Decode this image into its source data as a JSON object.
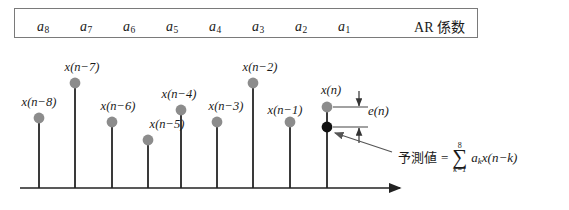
{
  "figure": {
    "coefficient_box": {
      "title": "AR 係数",
      "coefficients": [
        {
          "base": "a",
          "sub": "8",
          "x": 36
        },
        {
          "base": "a",
          "sub": "7",
          "x": 79
        },
        {
          "base": "a",
          "sub": "6",
          "x": 122
        },
        {
          "base": "a",
          "sub": "5",
          "x": 165
        },
        {
          "base": "a",
          "sub": "4",
          "x": 208
        },
        {
          "base": "a",
          "sub": "3",
          "x": 251
        },
        {
          "base": "a",
          "sub": "2",
          "x": 294
        },
        {
          "base": "a",
          "sub": "1",
          "x": 337
        }
      ]
    },
    "stems": [
      {
        "label": "x(n−8)",
        "x": 39,
        "dot_y": 118,
        "label_x": 39,
        "label_y": 96,
        "color": "#8c8c8c",
        "filled": false
      },
      {
        "label": "x(n−7)",
        "x": 75,
        "dot_y": 83,
        "label_x": 82,
        "label_y": 61,
        "color": "#8c8c8c",
        "filled": false
      },
      {
        "label": "x(n−6)",
        "x": 112,
        "dot_y": 122,
        "label_x": 118,
        "label_y": 100,
        "color": "#8c8c8c",
        "filled": false
      },
      {
        "label": "x(n−5)",
        "x": 148,
        "dot_y": 140,
        "label_x": 167,
        "label_y": 118,
        "color": "#8c8c8c",
        "filled": false
      },
      {
        "label": "x(n−4)",
        "x": 181,
        "dot_y": 110,
        "label_x": 179,
        "label_y": 88,
        "color": "#8c8c8c",
        "filled": false
      },
      {
        "label": "x(n−3)",
        "x": 217,
        "dot_y": 122,
        "label_x": 224,
        "label_y": 100,
        "color": "#8c8c8c",
        "filled": false
      },
      {
        "label": "x(n−2)",
        "x": 253,
        "dot_y": 83,
        "label_x": 260,
        "label_y": 61,
        "color": "#8c8c8c",
        "filled": false
      },
      {
        "label": "x(n−1)",
        "x": 290,
        "dot_y": 122,
        "label_x": 285,
        "label_y": 104,
        "color": "#8c8c8c",
        "filled": false
      },
      {
        "label": "x(n)",
        "x": 327,
        "dot_y": 107,
        "label_x": 330,
        "label_y": 84,
        "color": "#8c8c8c",
        "filled": false
      }
    ],
    "predicted_point": {
      "x": 327,
      "y": 127,
      "color": "#111111"
    },
    "error_annotation": {
      "label": "e(n)",
      "top_y": 107,
      "bottom_y": 127,
      "arrow_x": 359
    },
    "prediction_formula": {
      "jp_label": "予測値",
      "equals": "=",
      "sigma": "∑",
      "sigma_upper": "8",
      "sigma_lower_var": "k",
      "sigma_lower_eq": "=",
      "sigma_lower_val": "1",
      "term_a": "a",
      "term_a_sub": "k",
      "term_x": "x(n−k)"
    },
    "axis": {
      "y": 188,
      "x_start": 20,
      "x_end": 400
    },
    "colors": {
      "dot_gray": "#8c8c8c",
      "dot_black": "#111111",
      "stem_line": "#3a3a3a",
      "axis": "#222222",
      "box_border": "#7a7a7a",
      "leader": "#555555"
    }
  }
}
